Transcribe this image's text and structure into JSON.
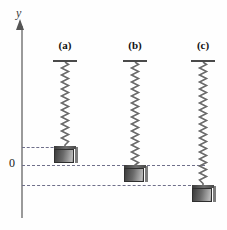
{
  "figure": {
    "background_color": "#fefefe",
    "width": 227,
    "height": 230,
    "axis": {
      "y_label": "y",
      "zero_label": "0",
      "axis_color": "#9a9a9a",
      "arrow_color": "#555555"
    },
    "dashed_line_color": "#6f6f8a",
    "spring_color": "#6a6a6a",
    "mass_color": "#6b6b6b",
    "columns": [
      {
        "label": "(a)",
        "center_x": 65,
        "support_y": 60,
        "spring_length": 86,
        "mass_top_y": 146,
        "dash_y": 147,
        "dash_left": 22,
        "dash_right": 62
      },
      {
        "label": "(b)",
        "center_x": 135,
        "support_y": 60,
        "spring_length": 105,
        "mass_top_y": 165,
        "dash_y": 165,
        "dash_left": 22,
        "dash_right": 205
      },
      {
        "label": "(c)",
        "center_x": 203,
        "support_y": 60,
        "spring_length": 125,
        "mass_top_y": 185,
        "dash_y": 185,
        "dash_left": 22,
        "dash_right": 196
      }
    ]
  }
}
